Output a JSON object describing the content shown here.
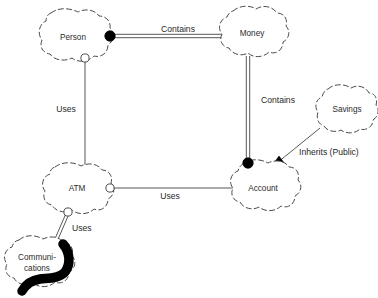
{
  "diagram": {
    "background_color": "#ffffff",
    "line_color": "#3a3a3a",
    "cloud_stroke_color": "#4a4a4a",
    "accent_color": "#000000",
    "nodes": [
      {
        "id": "person",
        "label": "Person",
        "cx": 73,
        "cy": 37
      },
      {
        "id": "money",
        "label": "Money",
        "cx": 252,
        "cy": 33
      },
      {
        "id": "savings",
        "label": "Savings",
        "cx": 347,
        "cy": 110
      },
      {
        "id": "account",
        "label": "Account",
        "cx": 262,
        "cy": 188
      },
      {
        "id": "atm",
        "label": "ATM",
        "cx": 76,
        "cy": 188
      },
      {
        "id": "communications",
        "label": "Communi-",
        "label2": "cations",
        "cx": 37,
        "cy": 262
      }
    ],
    "relations": [
      {
        "id": "person-contains-money",
        "label": "Contains",
        "kind": "containment-double-line",
        "from": "person",
        "to": "money",
        "label_x": 178,
        "label_y": 30
      },
      {
        "id": "money-contains-account",
        "label": "Contains",
        "kind": "containment-double-line",
        "from": "money",
        "to": "account",
        "label_x": 276,
        "label_y": 100
      },
      {
        "id": "person-uses-atm",
        "label": "Uses",
        "kind": "uses-single-line",
        "from": "person",
        "to": "atm",
        "label_x": 66,
        "label_y": 109
      },
      {
        "id": "atm-uses-account",
        "label": "Uses",
        "kind": "uses-single-line",
        "from": "atm",
        "to": "account",
        "label_x": 170,
        "label_y": 196
      },
      {
        "id": "atm-uses-communications",
        "label": "Uses",
        "kind": "uses-double-line",
        "from": "atm",
        "to": "communications",
        "label_x": 82,
        "label_y": 229
      },
      {
        "id": "savings-inherits-account",
        "label": "Inherits (Public)",
        "kind": "inheritance-arrow",
        "from": "savings",
        "to": "account",
        "label_x": 306,
        "label_y": 152
      }
    ]
  }
}
